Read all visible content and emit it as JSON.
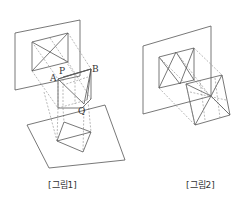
{
  "figures": [
    {
      "id": "fig1",
      "caption": "[그림1]",
      "point_labels": [
        "A",
        "P",
        "B",
        "Q"
      ],
      "description": "Cube with diagonal plane projected onto vertical and horizontal planes"
    },
    {
      "id": "fig2",
      "caption": "[그림2]",
      "point_labels": [],
      "description": "Cube projected onto vertical plane"
    }
  ],
  "colors": {
    "line": "#555555",
    "dashed": "#8a8a8a",
    "background": "#ffffff"
  }
}
